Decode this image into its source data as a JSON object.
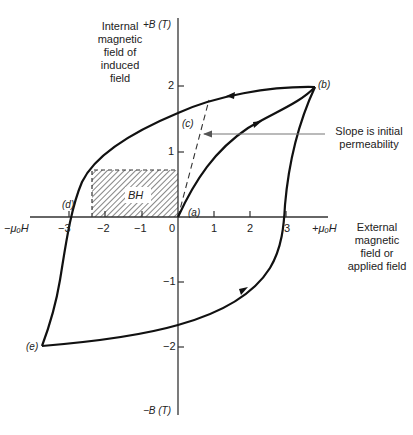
{
  "diagram": {
    "y_axis": {
      "top_label": "+B (T)",
      "bottom_label": "−B (T)",
      "description": "Internal magnetic field of induced field",
      "description_lines": [
        "Internal",
        "magnetic",
        "field of",
        "induced",
        "field"
      ],
      "ticks": [
        "2",
        "1",
        "−1",
        "−2"
      ]
    },
    "x_axis": {
      "right_label": "+μₒH",
      "left_label": "−μₒH",
      "description": "External magnetic field or applied field",
      "description_lines": [
        "External",
        "magnetic",
        "field or",
        "applied field"
      ],
      "ticks": [
        "−3",
        "−2",
        "−1",
        "0",
        "1",
        "2",
        "3"
      ]
    },
    "points": {
      "a": "(a)",
      "b": "(b)",
      "c": "(c)",
      "d": "(d)",
      "e": "(e)"
    },
    "annotation": {
      "lines": [
        "Slope is initial",
        "permeability"
      ]
    },
    "shaded_region": {
      "label": "BH"
    },
    "colors": {
      "curve": "#111111",
      "axis": "#333333",
      "arrow": "#777777"
    }
  }
}
